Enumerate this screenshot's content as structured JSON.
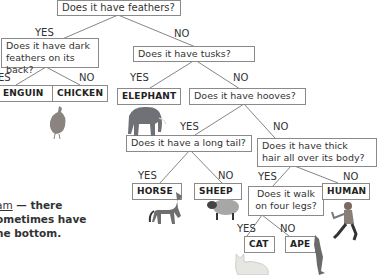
{
  "diagram": {
    "type": "decision-tree",
    "root": {
      "question": "Does it have feathers?"
    },
    "questions": {
      "q_feathers": "Does it have feathers?",
      "q_dark": "Does it have dark feathers on its back?",
      "q_dark_l1": "Does it have dark",
      "q_dark_l2": "feathers on its back?",
      "q_tusks": "Does it have tusks?",
      "q_hooves": "Does it have hooves?",
      "q_tail": "Does it have a long tail?",
      "q_hair_l1": "Does it have thick",
      "q_hair_l2": "hair all over its body?",
      "q_walk_l1": "Does it walk",
      "q_walk_l2": "on four legs?"
    },
    "leaves": {
      "penguin": "ENGUIN",
      "chicken": "CHICKEN",
      "elephant": "ELEPHANT",
      "horse": "HORSE",
      "sheep": "SHEEP",
      "human": "HUMAN",
      "cat": "CAT",
      "ape": "APE"
    },
    "branch_labels": {
      "yes": "YES",
      "no": "NO",
      "yes_cut": "ES"
    },
    "note": {
      "line1_underlined": "am",
      "line1_rest": " — there",
      "line2": "ometimes have",
      "line3": "he bottom."
    },
    "icons": [
      "chicken-picture",
      "elephant-picture",
      "horse-picture",
      "sheep-picture",
      "human-picture",
      "cat-picture",
      "ape-picture"
    ]
  }
}
